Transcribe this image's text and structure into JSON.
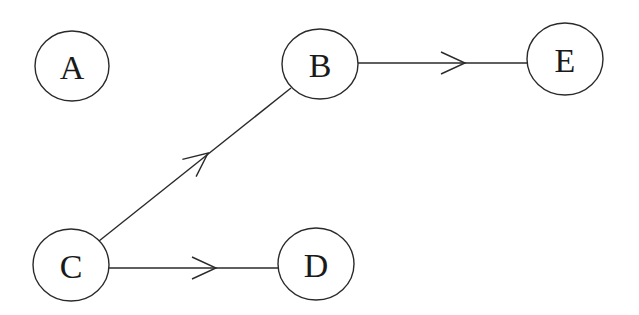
{
  "diagram": {
    "type": "directed-graph",
    "colors": {
      "stroke": "#2a2a2a",
      "background": "#ffffff",
      "text": "#1a1a1a"
    },
    "nodes": [
      {
        "id": "A",
        "label": "A",
        "cx": 72,
        "cy": 66,
        "rx": 37,
        "ry": 35
      },
      {
        "id": "B",
        "label": "B",
        "cx": 320,
        "cy": 64,
        "rx": 38,
        "ry": 35
      },
      {
        "id": "E",
        "label": "E",
        "cx": 565,
        "cy": 59,
        "rx": 38,
        "ry": 36
      },
      {
        "id": "C",
        "label": "C",
        "cx": 71,
        "cy": 265,
        "rx": 38,
        "ry": 36
      },
      {
        "id": "D",
        "label": "D",
        "cx": 316,
        "cy": 264,
        "rx": 38,
        "ry": 36
      }
    ],
    "edges": [
      {
        "from": "C",
        "to": "B",
        "x1": 99,
        "y1": 241,
        "x2": 291,
        "y2": 88,
        "tip_x": 208,
        "tip_y": 153
      },
      {
        "from": "B",
        "to": "E",
        "x1": 358,
        "y1": 63,
        "x2": 527,
        "y2": 63,
        "tip_x": 465,
        "tip_y": 63
      },
      {
        "from": "C",
        "to": "D",
        "x1": 109,
        "y1": 268,
        "x2": 278,
        "y2": 268,
        "tip_x": 216,
        "tip_y": 268
      }
    ]
  }
}
